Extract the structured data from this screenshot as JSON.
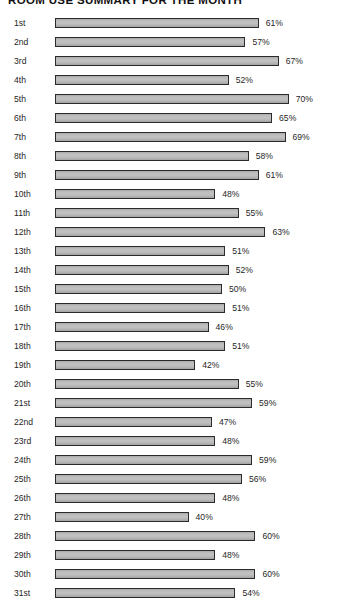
{
  "chart_data": {
    "type": "bar",
    "orientation": "horizontal",
    "title": "ROOM USE SUMMARY FOR THE MONTH",
    "xlabel": "",
    "ylabel": "",
    "xlim": [
      0,
      75
    ],
    "grid": false,
    "legend": null,
    "value_suffix": "%",
    "categories": [
      "1st",
      "2nd",
      "3rd",
      "4th",
      "5th",
      "6th",
      "7th",
      "8th",
      "9th",
      "10th",
      "11th",
      "12th",
      "13th",
      "14th",
      "15th",
      "16th",
      "17th",
      "18th",
      "19th",
      "20th",
      "21st",
      "22nd",
      "23rd",
      "24th",
      "25th",
      "26th",
      "27th",
      "28th",
      "29th",
      "30th",
      "31st"
    ],
    "values": [
      61,
      57,
      67,
      52,
      70,
      65,
      69,
      58,
      61,
      48,
      55,
      63,
      51,
      52,
      50,
      51,
      46,
      51,
      42,
      55,
      59,
      47,
      48,
      59,
      56,
      48,
      40,
      60,
      48,
      60,
      54
    ],
    "labels": [
      "61%",
      "57%",
      "67%",
      "52%",
      "70%",
      "65%",
      "69%",
      "58%",
      "61%",
      "48%",
      "55%",
      "63%",
      "51%",
      "52%",
      "50%",
      "51%",
      "46%",
      "51%",
      "42%",
      "55%",
      "59%",
      "47%",
      "48%",
      "59%",
      "56%",
      "48%",
      "40%",
      "60%",
      "48%",
      "60%",
      "54%"
    ],
    "bar_color": "#bdbdbd",
    "bar_border_color": "#2b2b2b",
    "background_color": "#ffffff"
  }
}
